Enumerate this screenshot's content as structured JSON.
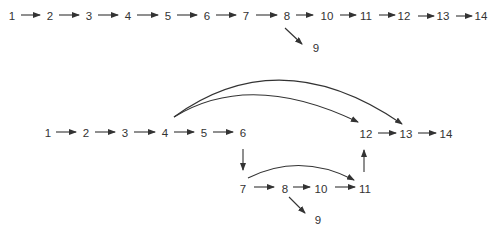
{
  "colors": {
    "ink": "#333333",
    "background": "#ffffff"
  },
  "diagrams": [
    {
      "name": "linear-sequence",
      "nodes": [
        {
          "id": "1",
          "label": "1",
          "x": 12,
          "y": 17
        },
        {
          "id": "2",
          "label": "2",
          "x": 50,
          "y": 17
        },
        {
          "id": "3",
          "label": "3",
          "x": 89,
          "y": 17
        },
        {
          "id": "4",
          "label": "4",
          "x": 128,
          "y": 17
        },
        {
          "id": "5",
          "label": "5",
          "x": 168,
          "y": 17
        },
        {
          "id": "6",
          "label": "6",
          "x": 207,
          "y": 17
        },
        {
          "id": "7",
          "label": "7",
          "x": 246,
          "y": 17
        },
        {
          "id": "8",
          "label": "8",
          "x": 287,
          "y": 17
        },
        {
          "id": "10",
          "label": "10",
          "x": 327,
          "y": 17
        },
        {
          "id": "11",
          "label": "11",
          "x": 366,
          "y": 17
        },
        {
          "id": "12",
          "label": "12",
          "x": 404,
          "y": 17
        },
        {
          "id": "13",
          "label": "13",
          "x": 443,
          "y": 17
        },
        {
          "id": "14",
          "label": "14",
          "x": 481,
          "y": 17
        },
        {
          "id": "9",
          "label": "9",
          "x": 316,
          "y": 49
        }
      ],
      "edges": [
        {
          "from": "1",
          "to": "2",
          "x1": 21,
          "y1": 15,
          "x2": 40,
          "y2": 15
        },
        {
          "from": "2",
          "to": "3",
          "x1": 59,
          "y1": 15,
          "x2": 79,
          "y2": 15
        },
        {
          "from": "3",
          "to": "4",
          "x1": 98,
          "y1": 15,
          "x2": 118,
          "y2": 15
        },
        {
          "from": "4",
          "to": "5",
          "x1": 137,
          "y1": 15,
          "x2": 158,
          "y2": 15
        },
        {
          "from": "5",
          "to": "6",
          "x1": 177,
          "y1": 15,
          "x2": 197,
          "y2": 15
        },
        {
          "from": "6",
          "to": "7",
          "x1": 216,
          "y1": 15,
          "x2": 236,
          "y2": 15
        },
        {
          "from": "7",
          "to": "8",
          "x1": 256,
          "y1": 15,
          "x2": 277,
          "y2": 15
        },
        {
          "from": "8",
          "to": "10",
          "x1": 296,
          "y1": 15,
          "x2": 313,
          "y2": 15
        },
        {
          "from": "10",
          "to": "11",
          "x1": 340,
          "y1": 15,
          "x2": 356,
          "y2": 15
        },
        {
          "from": "11",
          "to": "12",
          "x1": 379,
          "y1": 15,
          "x2": 395,
          "y2": 15
        },
        {
          "from": "12",
          "to": "13",
          "x1": 418,
          "y1": 16,
          "x2": 434,
          "y2": 16
        },
        {
          "from": "13",
          "to": "14",
          "x1": 456,
          "y1": 16,
          "x2": 472,
          "y2": 16
        },
        {
          "from": "8",
          "to": "9",
          "x1": 285,
          "y1": 28,
          "x2": 302,
          "y2": 44
        }
      ]
    },
    {
      "name": "network-with-parallel-paths",
      "nodes": [
        {
          "id": "1",
          "label": "1",
          "x": 48,
          "y": 134
        },
        {
          "id": "2",
          "label": "2",
          "x": 86,
          "y": 134
        },
        {
          "id": "3",
          "label": "3",
          "x": 125,
          "y": 134
        },
        {
          "id": "4",
          "label": "4",
          "x": 165,
          "y": 134
        },
        {
          "id": "5",
          "label": "5",
          "x": 204,
          "y": 134
        },
        {
          "id": "6",
          "label": "6",
          "x": 243,
          "y": 134
        },
        {
          "id": "12",
          "label": "12",
          "x": 366,
          "y": 135
        },
        {
          "id": "13",
          "label": "13",
          "x": 406,
          "y": 135
        },
        {
          "id": "14",
          "label": "14",
          "x": 446,
          "y": 135
        },
        {
          "id": "7",
          "label": "7",
          "x": 243,
          "y": 190
        },
        {
          "id": "8",
          "label": "8",
          "x": 285,
          "y": 190
        },
        {
          "id": "10",
          "label": "10",
          "x": 321,
          "y": 190
        },
        {
          "id": "11",
          "label": "11",
          "x": 365,
          "y": 190
        },
        {
          "id": "9",
          "label": "9",
          "x": 318,
          "y": 221
        }
      ],
      "edges": [
        {
          "from": "1",
          "to": "2",
          "type": "line",
          "x1": 56,
          "y1": 132,
          "x2": 76,
          "y2": 132
        },
        {
          "from": "2",
          "to": "3",
          "type": "line",
          "x1": 95,
          "y1": 132,
          "x2": 115,
          "y2": 132
        },
        {
          "from": "3",
          "to": "4",
          "type": "line",
          "x1": 134,
          "y1": 132,
          "x2": 155,
          "y2": 132
        },
        {
          "from": "4",
          "to": "5",
          "type": "line",
          "x1": 174,
          "y1": 132,
          "x2": 194,
          "y2": 132
        },
        {
          "from": "5",
          "to": "6",
          "type": "line",
          "x1": 213,
          "y1": 132,
          "x2": 233,
          "y2": 132
        },
        {
          "from": "6",
          "to": "7",
          "type": "line",
          "x1": 243,
          "y1": 149,
          "x2": 243,
          "y2": 170
        },
        {
          "from": "7",
          "to": "8",
          "type": "line",
          "x1": 254,
          "y1": 187,
          "x2": 274,
          "y2": 187
        },
        {
          "from": "8",
          "to": "10",
          "type": "line",
          "x1": 293,
          "y1": 187,
          "x2": 310,
          "y2": 187
        },
        {
          "from": "10",
          "to": "11",
          "type": "line",
          "x1": 335,
          "y1": 187,
          "x2": 355,
          "y2": 187
        },
        {
          "from": "8",
          "to": "9",
          "type": "line",
          "x1": 289,
          "y1": 197,
          "x2": 305,
          "y2": 213
        },
        {
          "from": "11",
          "to": "12",
          "type": "line",
          "x1": 364,
          "y1": 172,
          "x2": 364,
          "y2": 150
        },
        {
          "from": "12",
          "to": "13",
          "type": "line",
          "x1": 378,
          "y1": 133,
          "x2": 396,
          "y2": 133
        },
        {
          "from": "13",
          "to": "14",
          "type": "line",
          "x1": 418,
          "y1": 133,
          "x2": 436,
          "y2": 133
        },
        {
          "from": "4",
          "to": "12",
          "type": "curve",
          "d": "M 174 117 Q 250 70 358 122"
        },
        {
          "from": "4",
          "to": "13",
          "type": "curve",
          "d": "M 174 117 Q 280 40 402 124"
        },
        {
          "from": "7",
          "to": "11",
          "type": "curve",
          "d": "M 248 178 Q 300 152 354 180"
        }
      ]
    }
  ]
}
